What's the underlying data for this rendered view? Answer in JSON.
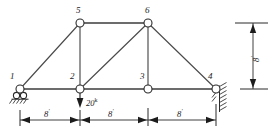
{
  "figure": {
    "type": "structural-truss-diagram",
    "background_color": "#ffffff",
    "line_color": "#3c3c3c",
    "text_color": "#1c1c1c"
  },
  "nodes": [
    {
      "id": "1",
      "label": "1",
      "x": 20,
      "y": 89,
      "support": "roller",
      "label_x": 10,
      "label_y": 74
    },
    {
      "id": "2",
      "label": "2",
      "x": 80,
      "y": 89,
      "support": "none",
      "label_x": 70,
      "label_y": 74
    },
    {
      "id": "3",
      "label": "3",
      "x": 148,
      "y": 89,
      "support": "none",
      "label_x": 139,
      "label_y": 74
    },
    {
      "id": "4",
      "label": "4",
      "x": 216,
      "y": 89,
      "support": "pin",
      "label_x": 207,
      "label_y": 74
    },
    {
      "id": "5",
      "label": "5",
      "x": 80,
      "y": 23,
      "support": "none",
      "label_x": 74,
      "label_y": 8
    },
    {
      "id": "6",
      "label": "6",
      "x": 148,
      "y": 23,
      "support": "none",
      "label_x": 143,
      "label_y": 8
    }
  ],
  "members": [
    {
      "from": "1",
      "to": "2",
      "kind": "bottom-chord"
    },
    {
      "from": "2",
      "to": "3",
      "kind": "bottom-chord"
    },
    {
      "from": "3",
      "to": "4",
      "kind": "bottom-chord"
    },
    {
      "from": "1",
      "to": "5",
      "kind": "top-chord-left"
    },
    {
      "from": "5",
      "to": "6",
      "kind": "top-chord"
    },
    {
      "from": "6",
      "to": "4",
      "kind": "top-chord-right"
    },
    {
      "from": "5",
      "to": "2",
      "kind": "vertical"
    },
    {
      "from": "6",
      "to": "3",
      "kind": "vertical"
    },
    {
      "from": "2",
      "to": "6",
      "kind": "diagonal"
    }
  ],
  "loads": [
    {
      "at_node": "2",
      "magnitude": "20",
      "unit": "k",
      "direction": "down",
      "label_x": 92,
      "label_y": 97
    }
  ],
  "dimensions": {
    "horizontal": {
      "baseline_y": 120,
      "segments": [
        {
          "label": "8",
          "unit": "'",
          "from_x": 20,
          "to_x": 80,
          "label_x": 44,
          "label_y": 110
        },
        {
          "label": "8",
          "unit": "'",
          "from_x": 80,
          "to_x": 148,
          "label_x": 108,
          "label_y": 110
        },
        {
          "label": "8",
          "unit": "'",
          "from_x": 148,
          "to_x": 216,
          "label_x": 177,
          "label_y": 110
        }
      ]
    },
    "vertical": {
      "line_x": 253,
      "from_y": 23,
      "to_y": 89,
      "label": "8",
      "unit": "'",
      "label_x": 249,
      "label_y": 62
    }
  },
  "supports": {
    "node_1": {
      "type": "roller",
      "description": "roller-support-with-hatching"
    },
    "node_4": {
      "type": "pin",
      "description": "pin-support-with-hatching"
    }
  }
}
